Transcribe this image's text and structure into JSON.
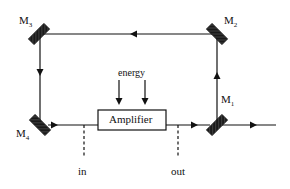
{
  "diagram": {
    "type": "ring laser cavity",
    "mirrors": [
      {
        "id": "M1",
        "label": "M",
        "sub": "1"
      },
      {
        "id": "M2",
        "label": "M",
        "sub": "2"
      },
      {
        "id": "M3",
        "label": "M",
        "sub": "3"
      },
      {
        "id": "M4",
        "label": "M",
        "sub": "4"
      }
    ],
    "amplifier_label": "Amplifier",
    "energy_label": "energy",
    "in_label": "in",
    "out_label": "out",
    "colors": {
      "line": "#111111",
      "mirror": "#1a1a1a",
      "background": "#ffffff"
    }
  }
}
